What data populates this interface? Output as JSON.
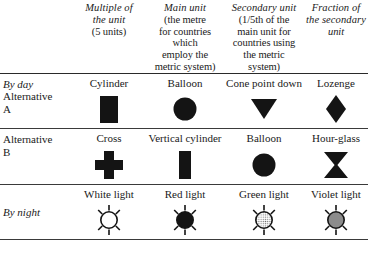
{
  "table": {
    "columns": [
      {
        "id": "multiple-of-the-unit",
        "title": "Multiple of",
        "title2": "the unit",
        "sub": [
          "(5 units)"
        ],
        "italic_sub": false
      },
      {
        "id": "main-unit",
        "title": "Main unit",
        "title2": "",
        "sub": [
          "(the metre",
          "for countries",
          "which",
          "employ the",
          "metric system)"
        ],
        "italic_sub": false
      },
      {
        "id": "secondary-unit",
        "title": "Secondary unit",
        "title2": "",
        "sub": [
          "(1/5th of the",
          "main unit for",
          "countries using",
          "the metric",
          "system)"
        ],
        "italic_sub": false
      },
      {
        "id": "fraction-of-the-secondary-unit",
        "title": "Fraction of",
        "title2": "the secondary",
        "sub": [
          "unit"
        ],
        "italic_sub": true
      }
    ],
    "rows": [
      {
        "id": "by-day-alternative-a",
        "stub_italic": "By day",
        "stub_roman_1": "Alternative",
        "stub_roman_2": "A",
        "cells": [
          {
            "id": "cylinder",
            "label": "Cylinder",
            "symbol": "filled-rectangle-vertical"
          },
          {
            "id": "balloon-a",
            "label": "Balloon",
            "symbol": "filled-circle"
          },
          {
            "id": "cone-point-down",
            "label": "Cone point down",
            "symbol": "filled-triangle-down"
          },
          {
            "id": "lozenge",
            "label": "Lozenge",
            "symbol": "filled-diamond"
          }
        ]
      },
      {
        "id": "alternative-b",
        "stub_italic": "",
        "stub_roman_1": "Alternative",
        "stub_roman_2": "B",
        "cells": [
          {
            "id": "cross",
            "label": "Cross",
            "symbol": "filled-cross"
          },
          {
            "id": "vertical-cylinder",
            "label": "Vertical cylinder",
            "symbol": "filled-rectangle-narrow"
          },
          {
            "id": "balloon-b",
            "label": "Balloon",
            "symbol": "filled-circle"
          },
          {
            "id": "hour-glass",
            "label": "Hour-glass",
            "symbol": "filled-hourglass"
          }
        ]
      },
      {
        "id": "by-night",
        "stub_italic": "By night",
        "stub_roman_1": "",
        "stub_roman_2": "",
        "cells": [
          {
            "id": "white-light",
            "label": "White light",
            "symbol": "rayed-circle",
            "fill": "#ffffff"
          },
          {
            "id": "red-light",
            "label": "Red light",
            "symbol": "rayed-circle",
            "fill": "#141414"
          },
          {
            "id": "green-light",
            "label": "Green light",
            "symbol": "rayed-circle",
            "fill": "hatched"
          },
          {
            "id": "violet-light",
            "label": "Violet light",
            "symbol": "rayed-circle",
            "fill": "#8c8c8c"
          }
        ]
      }
    ]
  },
  "colors": {
    "ink": "#141414",
    "rule": "#2a2a2a",
    "paper": "#ffffff",
    "violet_swatch": "#8c8c8c",
    "green_swatch": "#d8d8d8"
  }
}
